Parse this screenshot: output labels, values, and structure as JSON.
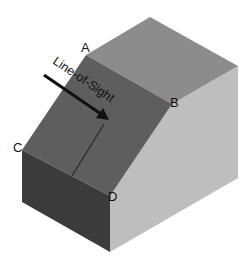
{
  "diagram": {
    "labels": {
      "a": "A",
      "b": "B",
      "c": "C",
      "d": "D",
      "line_of_sight": "Line-of-Sight"
    },
    "colors": {
      "background": "#ffffff",
      "top_face": "#8c8c8c",
      "inclined_face": "#5e5e5e",
      "front_face": "#3b3b3b",
      "right_face": "#bebebe",
      "arrow": "#111111",
      "normal_line": "#2a2a2a"
    }
  }
}
